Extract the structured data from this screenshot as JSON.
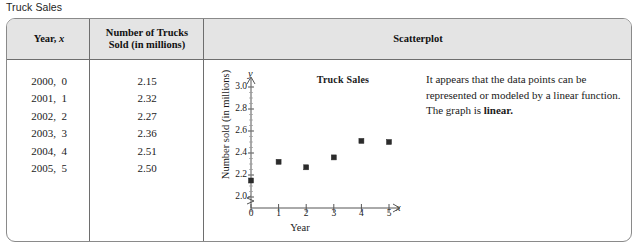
{
  "page_title": "Truck Sales",
  "table": {
    "headers": {
      "year": "Year, x",
      "year_plain": "Year,",
      "year_var": "x",
      "number": "Number of Trucks Sold (in millions)",
      "number_line1": "Number of Trucks",
      "number_line2": "Sold (in millions)",
      "scatterplot": "Scatterplot"
    },
    "rows": [
      {
        "year": "2000,  0",
        "value": "2.15"
      },
      {
        "year": "2001,  1",
        "value": "2.32"
      },
      {
        "year": "2002,  2",
        "value": "2.27"
      },
      {
        "year": "2003,  3",
        "value": "2.36"
      },
      {
        "year": "2004,  4",
        "value": "2.51"
      },
      {
        "year": "2005,  5",
        "value": "2.50"
      }
    ]
  },
  "explanation": {
    "paragraph1": "It appears that the data points can be represented or modeled by a linear function.",
    "paragraph2_prefix": "The graph is ",
    "paragraph2_emphasis": "linear."
  },
  "chart_data": {
    "type": "scatter",
    "title": "Truck Sales",
    "xlabel": "Year",
    "ylabel": "Number sold (in millions)",
    "x_var": "x",
    "y_var": "y",
    "x": [
      0,
      1,
      2,
      3,
      4,
      5
    ],
    "values": [
      2.15,
      2.32,
      2.27,
      2.36,
      2.51,
      2.5
    ],
    "xticks": [
      "0",
      "1",
      "2",
      "3",
      "4",
      "5"
    ],
    "yticks": [
      "2.0",
      "2.2",
      "2.4",
      "2.6",
      "2.8",
      "3.0"
    ],
    "xlim": [
      0,
      5
    ],
    "ylim": [
      2.0,
      3.0
    ],
    "axis_break_y": true,
    "grid": false,
    "legend": "none",
    "marker": "square",
    "marker_color": "#2b2b2b"
  }
}
